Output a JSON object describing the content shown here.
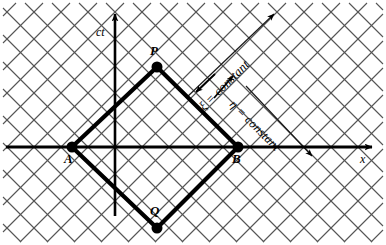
{
  "figure": {
    "kind": "spacetime-characteristic-diagram",
    "background_color": "#ffffff",
    "ink_color": "#000000",
    "grid_color": "#4d4d4d",
    "width": 386,
    "height": 245
  },
  "axes": {
    "vertical": {
      "label": "ct",
      "label_x": 96,
      "label_y": 26,
      "x": 115,
      "y_top": 14,
      "y_bottom": 216,
      "arrow": "up"
    },
    "horizontal": {
      "label": "x",
      "label_x": 360,
      "label_y": 153,
      "y": 147,
      "x_left": 6,
      "x_right": 372,
      "arrow": "right"
    }
  },
  "points": [
    {
      "id": "P",
      "label": "P",
      "x": 157,
      "y": 67,
      "label_x": 150,
      "label_y": 44,
      "radius": 5.5
    },
    {
      "id": "A",
      "label": "A",
      "x": 72,
      "y": 147,
      "label_x": 64,
      "label_y": 152,
      "radius": 5.5
    },
    {
      "id": "B",
      "label": "B",
      "x": 238,
      "y": 147,
      "label_x": 232,
      "label_y": 152,
      "radius": 5.5
    },
    {
      "id": "Q",
      "label": "Q",
      "x": 157,
      "y": 228,
      "label_x": 150,
      "label_y": 204,
      "radius": 5.5
    }
  ],
  "diamond": {
    "name": "characteristic-diamond-APBQ",
    "vertices": [
      [
        157,
        67
      ],
      [
        238,
        147
      ],
      [
        157,
        228
      ],
      [
        72,
        147
      ]
    ],
    "stroke_width": 4.2
  },
  "characteristics": [
    {
      "id": "xi",
      "text": "ξ = constant",
      "anchor_x": 197,
      "anchor_y": 104,
      "rotation_deg": -45,
      "arrow": {
        "x1": 215,
        "y1": 74,
        "x2": 196,
        "y2": 92,
        "direction": "down-left"
      },
      "line": {
        "x1": 186,
        "y1": 98,
        "x2": 274,
        "y2": 14,
        "direction": "up-right"
      },
      "line_arrow_tip": [
        268,
        16
      ]
    },
    {
      "id": "eta",
      "text": "η = constant",
      "anchor_x": 236,
      "anchor_y": 98,
      "rotation_deg": 45,
      "arrow": {
        "x1": 214,
        "y1": 98,
        "x2": 233,
        "y2": 76,
        "direction": "up-right"
      },
      "line": {
        "x1": 246,
        "y1": 86,
        "x2": 312,
        "y2": 156,
        "direction": "down-right"
      },
      "line_arrow_tip": [
        308,
        152
      ]
    }
  ],
  "grid": {
    "spacing_px": 27,
    "direction_a_deg": 45,
    "direction_b_deg": -45,
    "stroke_width": 1.1,
    "note": "45-degree null-characteristic mesh"
  }
}
